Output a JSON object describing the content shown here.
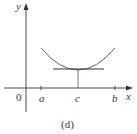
{
  "figure": {
    "caption": "(d)",
    "axes": {
      "x_label": "x",
      "y_label": "y",
      "origin_label": "0"
    },
    "ticks": [
      {
        "label": "a"
      },
      {
        "label": "c"
      },
      {
        "label": "b"
      }
    ],
    "colors": {
      "axis": "#4a4a4a",
      "curve": "#7a5a5a"
    }
  }
}
